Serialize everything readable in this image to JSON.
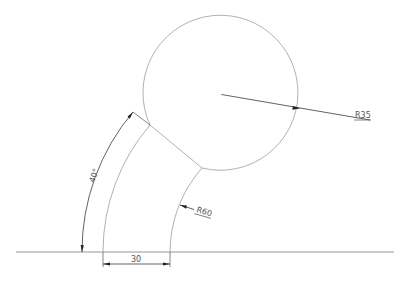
{
  "drawing": {
    "type": "CAD technical drawing",
    "colors": {
      "background": "#ffffff",
      "object_line": "#a8a8a8",
      "dimension_line": "#3a3a3a",
      "text": "#555555"
    },
    "circle": {
      "cx": 221.5,
      "cy": 94.5,
      "r": 77.5
    },
    "arc_center": {
      "x": 298,
      "y": 252
    },
    "baseline": {
      "y": 252,
      "x1": 16,
      "x2": 394
    },
    "dimensions": {
      "radius_circle": {
        "label": "R35"
      },
      "radius_arc": {
        "label": "R60"
      },
      "width": {
        "label": "30"
      },
      "angle": {
        "label": "40°"
      }
    }
  }
}
